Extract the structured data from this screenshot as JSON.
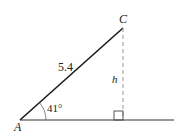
{
  "diagram": {
    "type": "right-triangle-height",
    "vertices": {
      "A": {
        "label": "A"
      },
      "C": {
        "label": "C"
      }
    },
    "side_AC": {
      "label": "5.4"
    },
    "height": {
      "label": "h"
    },
    "angle_A": {
      "label": "41°"
    },
    "colors": {
      "line": "#1a1a1a",
      "dashed": "#888888",
      "label": "#222222"
    }
  }
}
